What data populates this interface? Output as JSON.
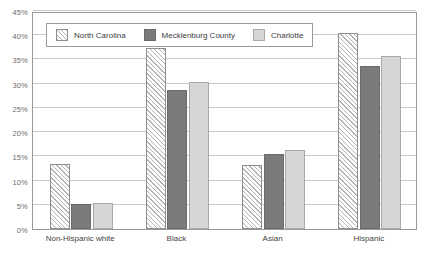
{
  "chart_data": {
    "type": "bar",
    "title": "",
    "subtitle": "",
    "xlabel": "",
    "ylabel": "",
    "grid": true,
    "legend_position": "top-left-inside",
    "categories": [
      "Non-Hispanic white",
      "Black",
      "Asian",
      "Hispanic"
    ],
    "ylim": [
      0,
      45
    ],
    "ytick_values": [
      0,
      5,
      10,
      15,
      20,
      25,
      30,
      35,
      40,
      45
    ],
    "ytick_labels": [
      "0%",
      "5%",
      "10%",
      "15%",
      "20%",
      "25%",
      "30%",
      "35%",
      "40%",
      "45%"
    ],
    "series": [
      {
        "name": "North Carolina",
        "color": "#ffffff",
        "pattern": "diagonal-hatch",
        "values": [
          13.5,
          37.3,
          13.3,
          40.5
        ]
      },
      {
        "name": "Mecklenburg County",
        "color": "#7b7b7b",
        "pattern": "solid",
        "values": [
          5.1,
          28.7,
          15.5,
          33.7
        ]
      },
      {
        "name": "Charlotte",
        "color": "#d6d6d6",
        "pattern": "solid",
        "values": [
          5.3,
          30.4,
          16.3,
          35.7
        ]
      }
    ]
  },
  "style": {
    "plot_border_color": "#9a9a9a",
    "gridline_color": "#c8c8c8",
    "tick_label_color": "#6d6d6d",
    "category_label_color": "#444444",
    "background": "#ffffff"
  }
}
